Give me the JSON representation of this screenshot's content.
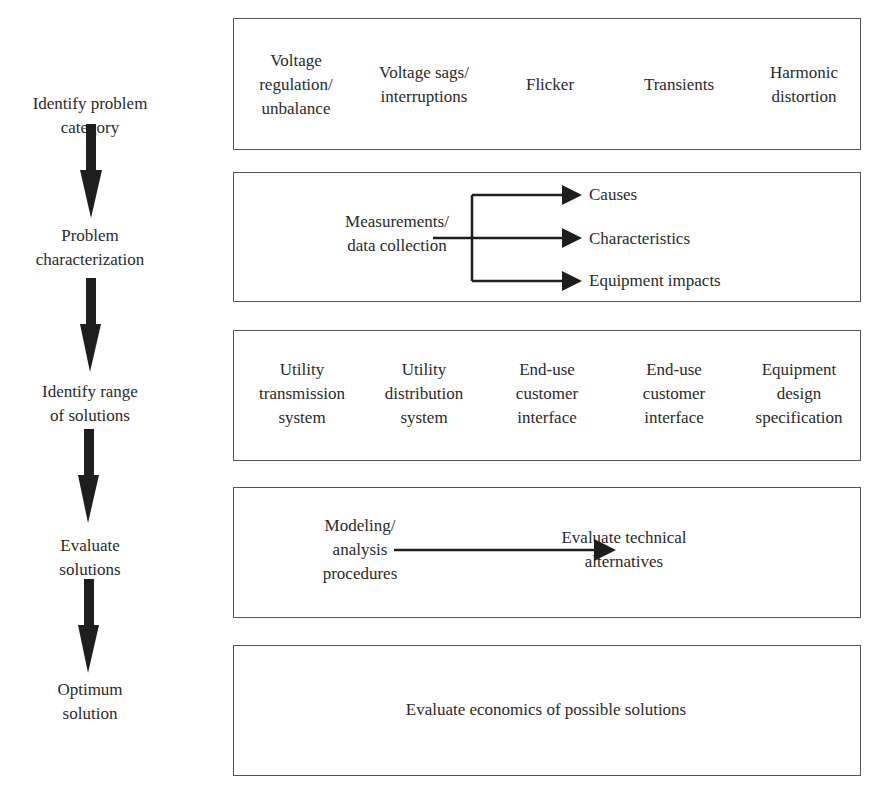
{
  "steps": [
    {
      "line1": "Identify problem",
      "line2": "category"
    },
    {
      "line1": "Problem",
      "line2": "characterization"
    },
    {
      "line1": "Identify range",
      "line2": "of solutions"
    },
    {
      "line1": "Evaluate",
      "line2": "solutions"
    },
    {
      "line1": "Optimum",
      "line2": "solution"
    }
  ],
  "box1": {
    "categories": [
      {
        "lines": [
          "Voltage",
          "regulation/",
          "unbalance"
        ]
      },
      {
        "lines": [
          "Voltage sags/",
          "interruptions"
        ]
      },
      {
        "lines": [
          "Flicker"
        ]
      },
      {
        "lines": [
          "Transients"
        ]
      },
      {
        "lines": [
          "Harmonic",
          "distortion"
        ]
      }
    ]
  },
  "box2": {
    "source": {
      "line1": "Measurements/",
      "line2": "data collection"
    },
    "outputs": [
      "Causes",
      "Characteristics",
      "Equipment impacts"
    ]
  },
  "box3": {
    "solutions": [
      {
        "lines": [
          "Utility",
          "transmission",
          "system"
        ]
      },
      {
        "lines": [
          "Utility",
          "distribution",
          "system"
        ]
      },
      {
        "lines": [
          "End-use",
          "customer",
          "interface"
        ]
      },
      {
        "lines": [
          "End-use",
          "customer",
          "interface"
        ]
      },
      {
        "lines": [
          "Equipment",
          "design",
          "specification"
        ]
      }
    ]
  },
  "box4": {
    "source": {
      "line1": "Modeling/",
      "line2": "analysis",
      "line3": "procedures"
    },
    "target": {
      "line1": "Evaluate technical",
      "line2": "alternatives"
    }
  },
  "box5": {
    "text": "Evaluate economics of possible solutions"
  }
}
